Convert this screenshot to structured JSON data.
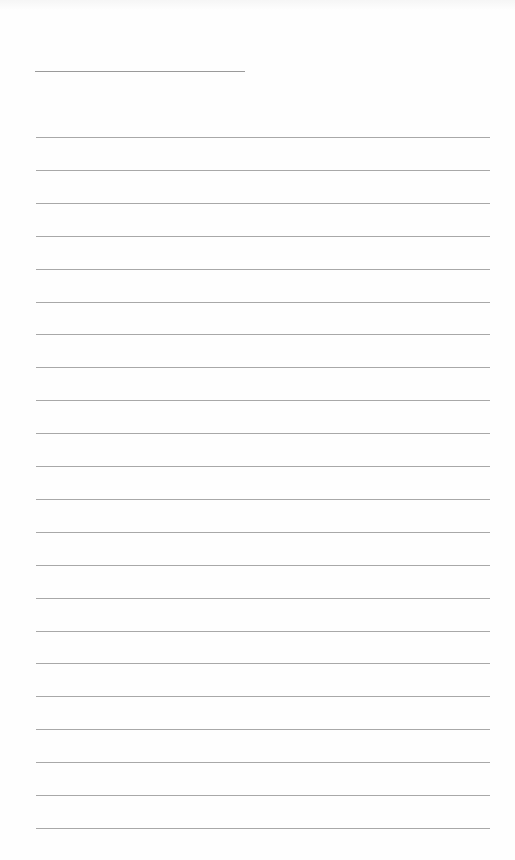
{
  "page": {
    "type": "lined-paper",
    "background_color": "#fefefe",
    "line_color": "#a8a8a8",
    "header_line": {
      "x": 35,
      "y": 71,
      "width": 210
    },
    "ruled_lines": {
      "count": 22,
      "x": 36,
      "width": 454,
      "first_y": 137,
      "spacing": 32.9
    }
  }
}
